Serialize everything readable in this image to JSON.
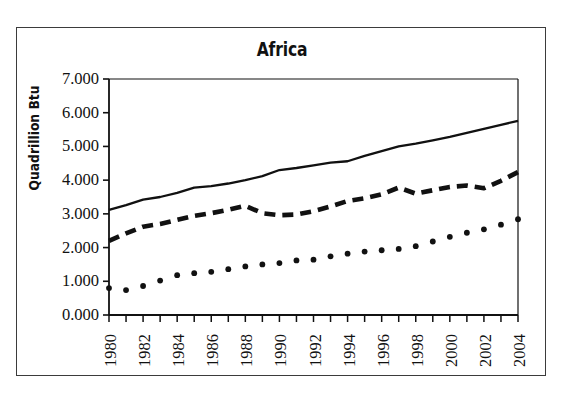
{
  "figure": {
    "title": "Africa",
    "y_axis_title": "Quadrillion Btu",
    "frame_color": "#3b3b3b",
    "background_color": "#ffffff",
    "ink_color": "#111111"
  },
  "chart_data": {
    "type": "line",
    "title": "Africa",
    "xlabel": "",
    "ylabel": "Quadrillion Btu",
    "xlim": [
      1980,
      2004
    ],
    "ylim": [
      0.0,
      7.0
    ],
    "grid": false,
    "legend": "none",
    "ytick_labels": [
      "7.000",
      "6.000",
      "5.000",
      "4.000",
      "3.000",
      "2.000",
      "1.000",
      "0.000"
    ],
    "ytick_values": [
      7.0,
      6.0,
      5.0,
      4.0,
      3.0,
      2.0,
      1.0,
      0.0
    ],
    "xtick_labels": [
      "1980",
      "1982",
      "1984",
      "1986",
      "1988",
      "1990",
      "1992",
      "1994",
      "1996",
      "1998",
      "2000",
      "2002",
      "2004"
    ],
    "xtick_values": [
      1980,
      1982,
      1984,
      1986,
      1988,
      1990,
      1992,
      1994,
      1996,
      1998,
      2000,
      2002,
      2004
    ],
    "x": [
      1980,
      1981,
      1982,
      1983,
      1984,
      1985,
      1986,
      1987,
      1988,
      1989,
      1990,
      1991,
      1992,
      1993,
      1994,
      1995,
      1996,
      1997,
      1998,
      1999,
      2000,
      2001,
      2002,
      2003,
      2004
    ],
    "series": [
      {
        "name": "solid-series",
        "style": "solid",
        "color": "#111111",
        "values": [
          3.12,
          3.26,
          3.42,
          3.5,
          3.62,
          3.78,
          3.82,
          3.9,
          4.0,
          4.12,
          4.3,
          4.36,
          4.44,
          4.52,
          4.56,
          4.72,
          4.86,
          5.0,
          5.08,
          5.18,
          5.28,
          5.4,
          5.52,
          5.64,
          5.76
        ]
      },
      {
        "name": "dashed-series",
        "style": "dashed",
        "color": "#111111",
        "values": [
          2.2,
          2.42,
          2.62,
          2.7,
          2.82,
          2.94,
          3.02,
          3.12,
          3.24,
          3.02,
          2.96,
          2.98,
          3.08,
          3.22,
          3.38,
          3.46,
          3.58,
          3.78,
          3.6,
          3.7,
          3.8,
          3.84,
          3.76,
          3.98,
          4.24
        ]
      },
      {
        "name": "dotted-series",
        "style": "dotted",
        "color": "#111111",
        "values": [
          0.8,
          0.74,
          0.86,
          1.02,
          1.18,
          1.24,
          1.28,
          1.36,
          1.44,
          1.5,
          1.54,
          1.62,
          1.64,
          1.74,
          1.82,
          1.88,
          1.92,
          1.96,
          2.04,
          2.18,
          2.32,
          2.44,
          2.54,
          2.68,
          2.84
        ]
      }
    ]
  }
}
